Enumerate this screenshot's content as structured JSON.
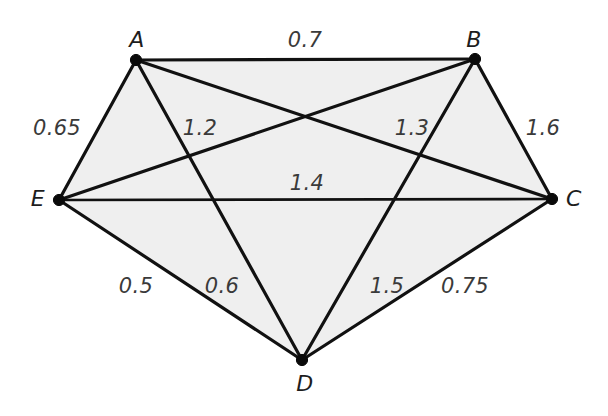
{
  "figure": {
    "type": "weighted-undirected-graph",
    "background_color": "#ffffff",
    "interior_fill_color": "#efefef",
    "edge_color": "#111111",
    "node_color": "#0a0a0a",
    "text_color": "#2b2b2b",
    "width": 608,
    "height": 416
  },
  "nodes": [
    {
      "id": "A",
      "label": "A",
      "x": 136,
      "y": 60,
      "label_x": 137,
      "label_y": 40
    },
    {
      "id": "B",
      "label": "B",
      "x": 475,
      "y": 59,
      "label_x": 474,
      "label_y": 40
    },
    {
      "id": "C",
      "label": "C",
      "x": 552,
      "y": 199,
      "label_x": 574,
      "label_y": 199
    },
    {
      "id": "D",
      "label": "D",
      "x": 302,
      "y": 360,
      "label_x": 305,
      "label_y": 384
    },
    {
      "id": "E",
      "label": "E",
      "x": 59,
      "y": 200,
      "label_x": 38,
      "label_y": 199
    }
  ],
  "edges": [
    {
      "id": "AB",
      "from": "A",
      "to": "B",
      "weight": "0.7",
      "label_x": 305,
      "label_y": 40
    },
    {
      "id": "AE",
      "from": "A",
      "to": "E",
      "weight": "0.65",
      "label_x": 57,
      "label_y": 128
    },
    {
      "id": "BE",
      "from": "B",
      "to": "E",
      "weight": "1.2",
      "label_x": 200,
      "label_y": 128
    },
    {
      "id": "AC",
      "from": "A",
      "to": "C",
      "weight": "1.3",
      "label_x": 412,
      "label_y": 128
    },
    {
      "id": "BC",
      "from": "B",
      "to": "C",
      "weight": "1.6",
      "label_x": 543,
      "label_y": 128
    },
    {
      "id": "EC",
      "from": "E",
      "to": "C",
      "weight": "1.4",
      "label_x": 307,
      "label_y": 183
    },
    {
      "id": "ED",
      "from": "E",
      "to": "D",
      "weight": "0.5",
      "label_x": 136,
      "label_y": 286
    },
    {
      "id": "AD",
      "from": "A",
      "to": "D",
      "weight": "0.6",
      "label_x": 222,
      "label_y": 286
    },
    {
      "id": "BD",
      "from": "B",
      "to": "D",
      "weight": "1.5",
      "label_x": 387,
      "label_y": 286
    },
    {
      "id": "CD",
      "from": "C",
      "to": "D",
      "weight": "0.75",
      "label_x": 465,
      "label_y": 286
    }
  ],
  "chart_data": {
    "type": "diagram",
    "title": "",
    "nodes": [
      "A",
      "B",
      "C",
      "D",
      "E"
    ],
    "edge_list": [
      [
        "A",
        "B",
        0.7
      ],
      [
        "A",
        "E",
        0.65
      ],
      [
        "B",
        "E",
        1.2
      ],
      [
        "A",
        "C",
        1.3
      ],
      [
        "B",
        "C",
        1.6
      ],
      [
        "E",
        "C",
        1.4
      ],
      [
        "E",
        "D",
        0.5
      ],
      [
        "A",
        "D",
        0.6
      ],
      [
        "B",
        "D",
        1.5
      ],
      [
        "C",
        "D",
        0.75
      ]
    ],
    "node_positions": {
      "A": [
        136,
        60
      ],
      "B": [
        475,
        59
      ],
      "C": [
        552,
        199
      ],
      "D": [
        302,
        360
      ],
      "E": [
        59,
        200
      ]
    }
  }
}
